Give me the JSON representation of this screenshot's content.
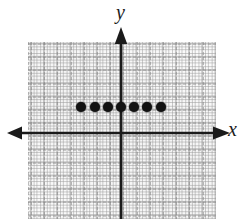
{
  "figure": {
    "title": "",
    "background_color": "#ffffff",
    "grid_paper_color": "#fafafa",
    "grid_line_color": "#969696",
    "axis_color": "#1b1b1b",
    "point_color": "#121212"
  },
  "axes": {
    "x_label": "x",
    "y_label": "y",
    "x_arrow_left": "arrow-left",
    "x_arrow_right": "arrow-right",
    "y_arrow_up": "arrow-up",
    "origin_px": {
      "x": 121,
      "y": 133
    },
    "grid_spacing_px": 13.2
  },
  "chart_data": {
    "type": "scatter",
    "title": "",
    "xlabel": "x",
    "ylabel": "y",
    "grid": true,
    "legend": null,
    "xlim": [
      -7,
      7
    ],
    "ylim": [
      -6,
      7
    ],
    "x": [
      -3,
      -2,
      -1,
      0,
      1,
      2,
      3
    ],
    "y": [
      2,
      2,
      2,
      2,
      2,
      2,
      2
    ],
    "point_count": 7,
    "points": [
      {
        "x": -3,
        "y": 2
      },
      {
        "x": -2,
        "y": 2
      },
      {
        "x": -1,
        "y": 2
      },
      {
        "x": 0,
        "y": 2
      },
      {
        "x": 1,
        "y": 2
      },
      {
        "x": 2,
        "y": 2
      },
      {
        "x": 3,
        "y": 2
      }
    ],
    "tick_labels": {
      "x": [],
      "y": []
    },
    "annotations": []
  }
}
